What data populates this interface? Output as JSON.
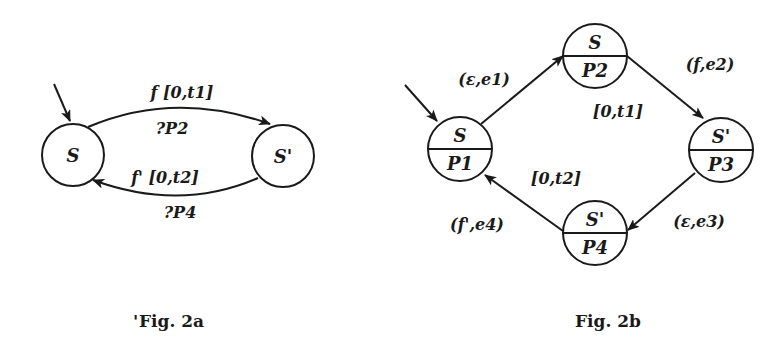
{
  "fig2a": {
    "caption": "Fig. 2a",
    "caption_mark": "'",
    "nodes": [
      {
        "id": "S",
        "label": "S"
      },
      {
        "id": "S_prime",
        "label": "S'"
      }
    ],
    "edges": [
      {
        "from": "S",
        "to": "S_prime",
        "label_top": "f [0,t1]",
        "label_bottom": "?P2"
      },
      {
        "from": "S_prime",
        "to": "S",
        "label_top": "f' [0,t2]",
        "label_bottom": "?P4"
      }
    ],
    "initial": "S"
  },
  "fig2b": {
    "caption": "Fig. 2b",
    "nodes": [
      {
        "id": "n1",
        "state": "S",
        "pred": "P1"
      },
      {
        "id": "n2",
        "state": "S",
        "pred": "P2"
      },
      {
        "id": "n3",
        "state": "S'",
        "pred": "P3"
      },
      {
        "id": "n4",
        "state": "S'",
        "pred": "P4"
      }
    ],
    "edges": [
      {
        "from": "n1",
        "to": "n2",
        "label": "(ε,e1)"
      },
      {
        "from": "n2",
        "to": "n3",
        "label": "(f,e2)",
        "interval": "[0,t1]"
      },
      {
        "from": "n3",
        "to": "n4",
        "label": "(ε,e3)"
      },
      {
        "from": "n4",
        "to": "n1",
        "label": "(f',e4)",
        "interval": "[0,t2]"
      }
    ],
    "initial": "n1"
  },
  "colors": {
    "ink": "#1a1a1a",
    "background": "#ffffff"
  }
}
